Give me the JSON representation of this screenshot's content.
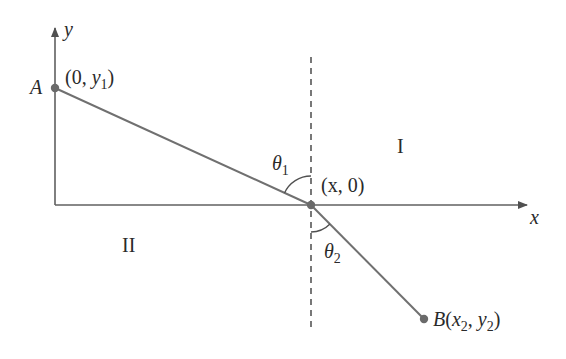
{
  "diagram": {
    "axes": {
      "x_label": "x",
      "y_label": "y"
    },
    "points": {
      "A": {
        "name": "A",
        "coord_prefix": "(0, ",
        "coord_var": "y",
        "coord_sub": "1",
        "coord_suffix": ")"
      },
      "P": {
        "coord": "(x, 0)"
      },
      "B": {
        "name": "B",
        "open": "(",
        "x": "x",
        "x_sub": "2",
        "sep": ", ",
        "y": "y",
        "y_sub": "2",
        "close": ")"
      }
    },
    "angles": {
      "theta1": {
        "sym": "θ",
        "sub": "1"
      },
      "theta2": {
        "sym": "θ",
        "sub": "2"
      }
    },
    "regions": {
      "upper_right": "I",
      "lower_left": "II"
    },
    "colors": {
      "line": "#707070",
      "axis": "#606060",
      "point": "#6a6a6a",
      "text": "#2a2a2a"
    }
  }
}
